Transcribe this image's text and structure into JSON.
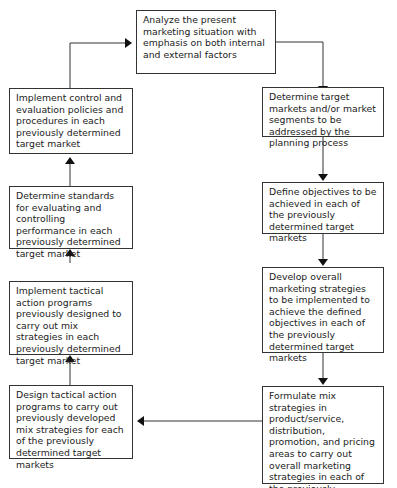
{
  "diagram": {
    "type": "flowchart",
    "steps": [
      {
        "id": "analyze",
        "text": "Analyze the present marketing situation with emphasis on both internal and external factors"
      },
      {
        "id": "target",
        "text": "Determine target markets and/or market segments to be addressed by the planning process"
      },
      {
        "id": "objectives",
        "text": "Define objectives to be achieved in each of the previously determined target markets"
      },
      {
        "id": "strategies",
        "text": "Develop overall marketing strategies to be implemented to achieve the defined objectives in each of the previously determined target markets"
      },
      {
        "id": "mix",
        "text": "Formulate mix strategies in product/service, distribution, promotion, and pricing areas to carry out overall marketing strategies in each of the previously determined target markets"
      },
      {
        "id": "design",
        "text": "Design tactical action programs to carry out previously developed mix strategies for each of the previously determined target markets"
      },
      {
        "id": "implement",
        "text": "Implement tactical action programs previously designed to carry out mix strategies in each previously determined target market"
      },
      {
        "id": "standards",
        "text": "Determine standards for evaluating and controlling performance in each previously determined target market"
      },
      {
        "id": "control",
        "text": "Implement control and evaluation policies and procedures in each previously determined target market"
      }
    ],
    "edges": [
      [
        "analyze",
        "target"
      ],
      [
        "target",
        "objectives"
      ],
      [
        "objectives",
        "strategies"
      ],
      [
        "strategies",
        "mix"
      ],
      [
        "mix",
        "design"
      ],
      [
        "design",
        "implement"
      ],
      [
        "implement",
        "standards"
      ],
      [
        "standards",
        "control"
      ],
      [
        "control",
        "analyze"
      ]
    ]
  }
}
